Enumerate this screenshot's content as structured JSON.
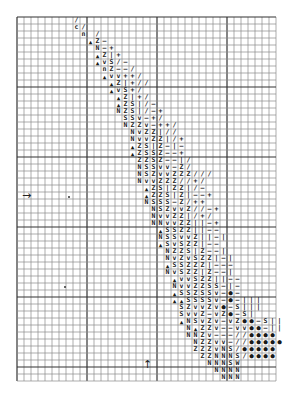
{
  "pattern": {
    "title": "",
    "grid": {
      "origin_x": 17,
      "origin_y": 17,
      "cell": 7,
      "cols": 37,
      "rows": 52,
      "major_every": 10,
      "thin_color": "#8a8a8a",
      "major_color": "#333333"
    },
    "symbol_key": {
      "A": "▲",
      "N": "N",
      "Z": "Z",
      "S": "S",
      "V": "v",
      "I": "|",
      "-": "–",
      "+": "+",
      "/": "/",
      "*": "●",
      "W": "W",
      "C": "c",
      "n": "n"
    },
    "rows": [
      {
        "r": 1,
        "c": 9,
        "s": "/"
      },
      {
        "r": 2,
        "c": 9,
        "s": "C/"
      },
      {
        "r": 3,
        "c": 10,
        "s": "n /"
      },
      {
        "r": 4,
        "c": 11,
        "s": "AZ-"
      },
      {
        "r": 5,
        "c": 12,
        "s": "N-+"
      },
      {
        "r": 6,
        "c": 12,
        "s": "AZI+"
      },
      {
        "r": 7,
        "c": 12,
        "s": "AVS/-"
      },
      {
        "r": 8,
        "c": 13,
        "s": "nZ--/"
      },
      {
        "r": 9,
        "c": 13,
        "s": "AVV++/"
      },
      {
        "r": 10,
        "c": 14,
        "s": "AZI+//"
      },
      {
        "r": 11,
        "c": 14,
        "s": "AVS+/"
      },
      {
        "r": 12,
        "c": 15,
        "s": "AZI+/"
      },
      {
        "r": 13,
        "c": 15,
        "s": "AZSI/-"
      },
      {
        "r": 14,
        "c": 15,
        "s": "NZSI/-+"
      },
      {
        "r": 15,
        "c": 16,
        "s": "SSV-+/"
      },
      {
        "r": 16,
        "c": 16,
        "s": "NZZV-++/"
      },
      {
        "r": 17,
        "c": 17,
        "s": "NVZZI//"
      },
      {
        "r": 18,
        "c": 17,
        "s": "NVVZZI/+"
      },
      {
        "r": 19,
        "c": 17,
        "s": "AZSIZ-I-"
      },
      {
        "r": 20,
        "c": 17,
        "s": "AZSSZ--+"
      },
      {
        "r": 21,
        "c": 18,
        "s": "ZZSZ--I/"
      },
      {
        "r": 22,
        "c": 18,
        "s": "NSSVV-Z/"
      },
      {
        "r": 23,
        "c": 18,
        "s": "NSZVVZZZ///"
      },
      {
        "r": 24,
        "c": 18,
        "s": "NVVZZZ//+/"
      },
      {
        "r": 25,
        "c": 19,
        "s": "AZSIZZI/-"
      },
      {
        "r": 26,
        "c": 19,
        "s": "AZZSIZI--+"
      },
      {
        "r": 27,
        "c": 19,
        "s": "NSSS-Z/++"
      },
      {
        "r": 28,
        "c": 20,
        "s": "NSZVVZ//-+"
      },
      {
        "r": 29,
        "c": 20,
        "s": "NVVZZI/+/"
      },
      {
        "r": 30,
        "c": 20,
        "s": "NNVVZZII-+"
      },
      {
        "r": 31,
        "c": 21,
        "s": "ASSZZII--"
      },
      {
        "r": 32,
        "c": 21,
        "s": "NSSVVZII-I"
      },
      {
        "r": 33,
        "c": 21,
        "s": "ASVSZZI--"
      },
      {
        "r": 34,
        "c": 22,
        "s": "NZZSIZ--I"
      },
      {
        "r": 35,
        "c": 22,
        "s": "NVZVSZZI-I"
      },
      {
        "r": 36,
        "c": 22,
        "s": "ASSZZZI---"
      },
      {
        "r": 37,
        "c": 22,
        "s": "NVSZZIZ--I"
      },
      {
        "r": 38,
        "c": 23,
        "s": "AVVSZZII--"
      },
      {
        "r": 39,
        "c": 23,
        "s": "NVVZZSS-I-"
      },
      {
        "r": 40,
        "c": 23,
        "s": "ASSZSSV-*-"
      },
      {
        "r": 41,
        "c": 23,
        "s": "AASSSSV-*-III"
      },
      {
        "r": 42,
        "c": 24,
        "s": "SZVVZV*-SIII"
      },
      {
        "r": 43,
        "c": 24,
        "s": "SVVZ-VZ*-SI"
      },
      {
        "r": 44,
        "c": 24,
        "s": "ANSVZV-VZ**-SII"
      },
      {
        "r": 45,
        "c": 25,
        "s": "NAZZV--VV**-II"
      },
      {
        "r": 46,
        "c": 25,
        "s": "NNZV---//****"
      },
      {
        "r": 47,
        "c": 26,
        "s": "NZZVV-//*****"
      },
      {
        "r": 48,
        "c": 26,
        "s": "ZZZVNS/*****"
      },
      {
        "r": 49,
        "c": 27,
        "s": "ZZNNNS/****"
      },
      {
        "r": 50,
        "c": 28,
        "s": "NNNSW"
      },
      {
        "r": 51,
        "c": 29,
        "s": "NNNN"
      },
      {
        "r": 52,
        "c": 30,
        "s": "NNN"
      }
    ],
    "markers": [
      {
        "name": "center-arrow-left",
        "glyph": "→",
        "x": 22,
        "y": 189
      },
      {
        "name": "center-arrow-bottom",
        "glyph": "↑",
        "x": 143,
        "y": 358
      }
    ],
    "specks": [
      {
        "x": 68,
        "y": 196
      },
      {
        "x": 64,
        "y": 286
      }
    ]
  }
}
